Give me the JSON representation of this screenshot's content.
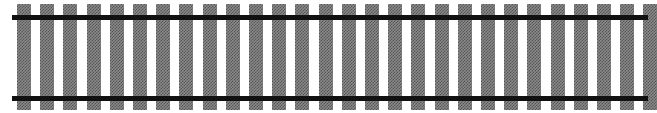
{
  "illustration": {
    "subject": "railroad-track",
    "tie_count": 28,
    "tie_start_x": 17,
    "tie_spacing": 23.2,
    "rails": [
      {
        "name": "top-rail",
        "y": 15
      },
      {
        "name": "bottom-rail",
        "y": 96
      }
    ],
    "colors": {
      "rail": "#111111",
      "tie": "#8a8a8a",
      "background": "#ffffff"
    }
  }
}
